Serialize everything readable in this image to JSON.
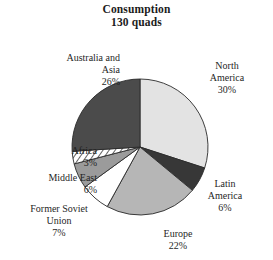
{
  "chart_data": {
    "type": "pie",
    "title": "Consumption",
    "subtitle": "130 quads",
    "xlabel": "",
    "ylabel": "",
    "legend": "none",
    "grid": false,
    "start_angle_deg": 0,
    "direction": "clockwise",
    "total_label": "130 quads",
    "units": "quads",
    "categories": [
      "North America",
      "Latin America",
      "Europe",
      "Former Soviet Union",
      "Middle East",
      "Africa",
      "Australia and Asia"
    ],
    "values": [
      30,
      6,
      22,
      7,
      6,
      3,
      26
    ],
    "value_labels": [
      "30%",
      "6%",
      "22%",
      "7%",
      "6%",
      "3%",
      "26%"
    ],
    "slices": [
      {
        "name": "North America",
        "label_line1": "North",
        "label_line2": "America",
        "percent_label": "30%",
        "value": 30,
        "fill": "#e3e3e3",
        "pattern": "solid"
      },
      {
        "name": "Latin America",
        "label_line1": "Latin",
        "label_line2": "America",
        "percent_label": "6%",
        "value": 6,
        "fill": "#373737",
        "pattern": "solid"
      },
      {
        "name": "Europe",
        "label_line1": "Europe",
        "label_line2": "",
        "percent_label": "22%",
        "value": 22,
        "fill": "#b6b6b6",
        "pattern": "solid"
      },
      {
        "name": "Former Soviet Union",
        "label_line1": "Former Soviet",
        "label_line2": "Union",
        "percent_label": "7%",
        "value": 7,
        "fill": "#ffffff",
        "pattern": "solid"
      },
      {
        "name": "Middle East",
        "label_line1": "Middle East",
        "label_line2": "",
        "percent_label": "6%",
        "value": 6,
        "fill": "#9b9b9b",
        "pattern": "solid"
      },
      {
        "name": "Africa",
        "label_line1": "Africa",
        "label_line2": "",
        "percent_label": "3%",
        "value": 3,
        "fill": "#ffffff",
        "pattern": "diagonal-hatch"
      },
      {
        "name": "Australia and Asia",
        "label_line1": "Australia and",
        "label_line2": "Asia",
        "percent_label": "26%",
        "value": 26,
        "fill": "#4b4b4b",
        "pattern": "solid"
      }
    ],
    "colors": {
      "outline": "#2a2a2a",
      "text": "#1f1f1f",
      "background": "#ffffff"
    }
  }
}
